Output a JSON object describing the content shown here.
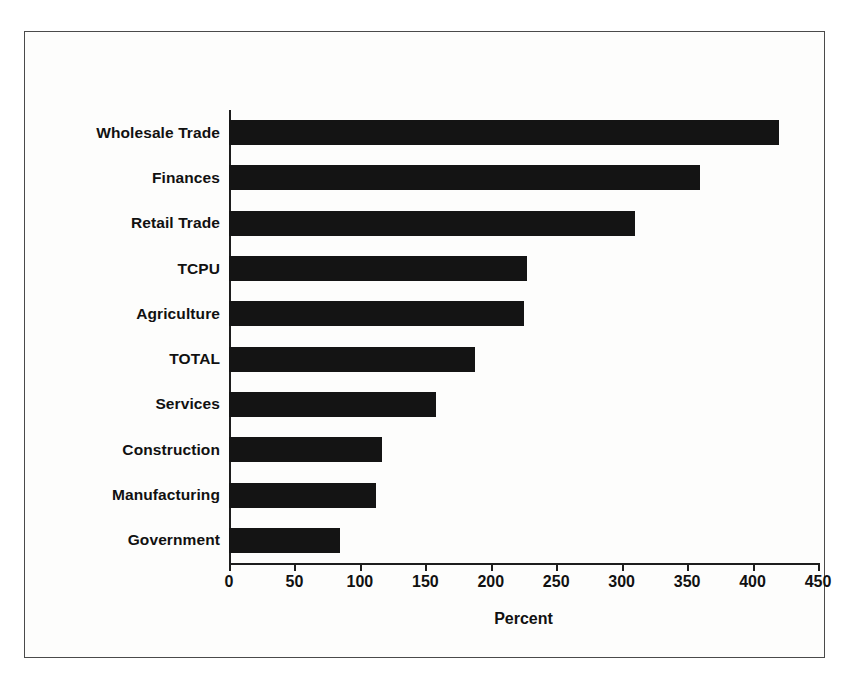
{
  "chart_data": {
    "type": "bar",
    "orientation": "horizontal",
    "title": "",
    "xlabel": "Percent",
    "ylabel": "",
    "categories": [
      "Wholesale Trade",
      "Finances",
      "Retail Trade",
      "TCPU",
      "Agriculture",
      "TOTAL",
      "Services",
      "Construction",
      "Manufacturing",
      "Government"
    ],
    "values": [
      420,
      360,
      310,
      228,
      225,
      188,
      158,
      117,
      112,
      85
    ],
    "xlim": [
      0,
      450
    ],
    "xticks": [
      0,
      50,
      100,
      150,
      200,
      250,
      300,
      350,
      400,
      450
    ],
    "xtick_labels": [
      "0",
      "50",
      "100",
      "150",
      "200",
      "250",
      "300",
      "350",
      "400",
      "450"
    ],
    "grid": false,
    "legend": null,
    "bar_color": "#141414",
    "axis_color": "#1d1d1d",
    "background_color": "#fdfdfc",
    "frame_color": "#4a4a4a"
  }
}
